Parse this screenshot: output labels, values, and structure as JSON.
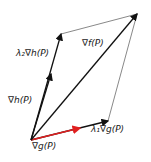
{
  "diagram": {
    "labels": {
      "grad_f": "∇f(P)",
      "grad_h": "∇h(P)",
      "lambda2_grad_h": "λ₂∇h(P)",
      "grad_g": "∇g(P)",
      "lambda1_grad_g": "λ₁∇g(P)"
    },
    "colors": {
      "vector": "#111111",
      "grad_g": "#e02020",
      "edge": "#555555"
    }
  }
}
